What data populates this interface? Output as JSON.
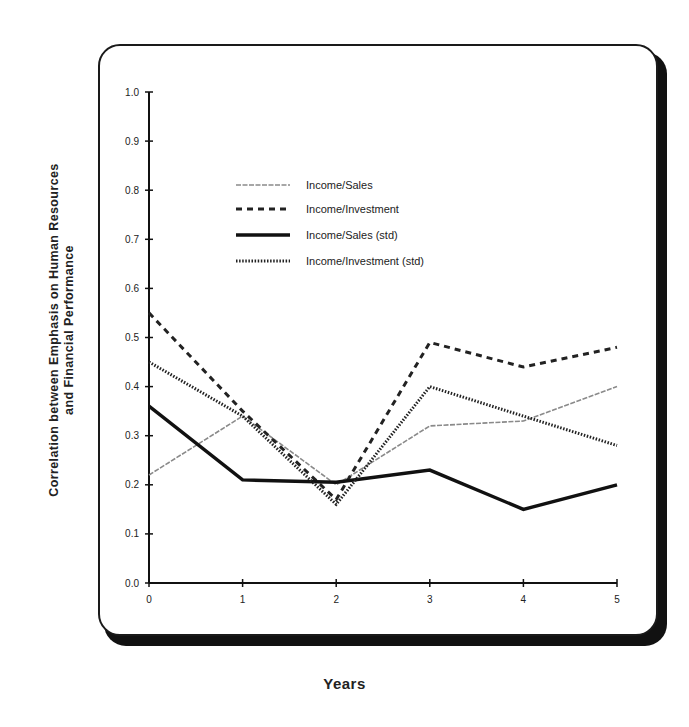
{
  "chart_data": {
    "type": "line",
    "title": "",
    "xlabel": "Years",
    "ylabel_line1": "Correlation between Emphasis on Human Resources",
    "ylabel_line2": "and Financial Performance",
    "x": [
      0,
      1,
      2,
      3,
      4,
      5
    ],
    "x_tick_labels": [
      "0",
      "1",
      "2",
      "3",
      "4",
      "5"
    ],
    "y_tick_labels": [
      "0.0",
      "0.1",
      "0.2",
      "0.3",
      "0.4",
      "0.5",
      "0.6",
      "0.7",
      "0.8",
      "0.9",
      "1.0"
    ],
    "ylim": [
      0.0,
      1.0
    ],
    "xlim": [
      0,
      5
    ],
    "grid": false,
    "legend_position": "upper center inside plot",
    "series": [
      {
        "name": "Income/Sales",
        "style": "thin-gray",
        "values": [
          0.22,
          0.34,
          0.2,
          0.32,
          0.33,
          0.4
        ]
      },
      {
        "name": "Income/Investment",
        "style": "dashed",
        "values": [
          0.55,
          0.35,
          0.17,
          0.49,
          0.44,
          0.48
        ]
      },
      {
        "name": "Income/Sales (std)",
        "style": "thick-solid",
        "values": [
          0.36,
          0.21,
          0.205,
          0.23,
          0.15,
          0.2
        ]
      },
      {
        "name": "Income/Investment (std)",
        "style": "dense-dotted",
        "values": [
          0.45,
          0.34,
          0.16,
          0.4,
          0.34,
          0.28
        ]
      }
    ]
  }
}
